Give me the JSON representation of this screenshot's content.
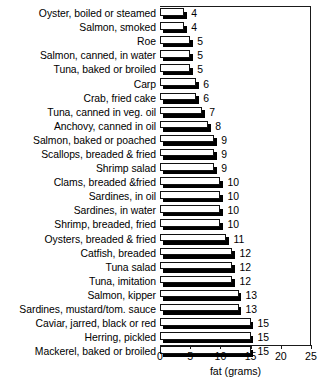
{
  "chart_data": {
    "type": "bar",
    "orientation": "horizontal",
    "title": "",
    "xlabel": "fat (grams)",
    "ylabel": "",
    "xlim": [
      0,
      25
    ],
    "xticks": [
      0,
      5,
      10,
      15,
      20,
      25
    ],
    "grid": false,
    "legend": null,
    "value_labels": true,
    "categories": [
      "Oyster, boiled or steamed",
      "Salmon, smoked",
      "Roe",
      "Salmon, canned, in water",
      "Tuna, baked or broiled",
      "Carp",
      "Crab, fried cake",
      "Tuna, canned in veg. oil",
      "Anchovy, canned in oil",
      "Salmon, baked or poached",
      "Scallops, breaded & fried",
      "Shrimp salad",
      "Clams, breaded &fried",
      "Sardines, in oil",
      "Sardines, in water",
      "Shrimp, breaded, fried",
      "Oysters, breaded & fried",
      "Catfish, breaded",
      "Tuna salad",
      "Tuna, imitation",
      "Salmon, kipper",
      "Sardines, mustard/tom. sauce",
      "Caviar, jarred, black or red",
      "Herring, pickled",
      "Mackerel, baked or broiled"
    ],
    "values": [
      4,
      4,
      5,
      5,
      5,
      6,
      6,
      7,
      8,
      9,
      9,
      9,
      10,
      10,
      10,
      10,
      11,
      12,
      12,
      12,
      13,
      13,
      15,
      15,
      15
    ]
  },
  "axis": {
    "tick_labels": [
      "0",
      "5",
      "10",
      "15",
      "20",
      "25"
    ],
    "title": "fat (grams)"
  }
}
